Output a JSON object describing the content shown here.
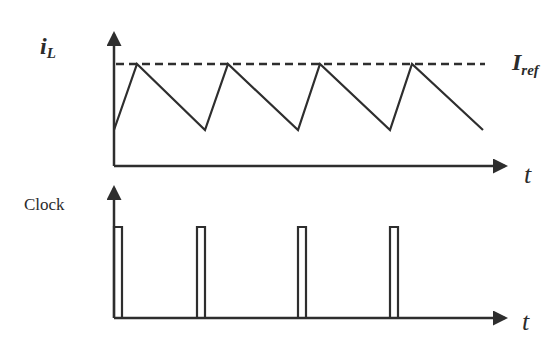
{
  "colors": {
    "line": "#2e2e2e",
    "background": "#ffffff"
  },
  "top_plot": {
    "y_label_main": "i",
    "y_label_sub": "L",
    "ref_label_main": "I",
    "ref_label_sub": "ref",
    "x_label": "t",
    "waveform_points": "114,130 137,64 205,130 228,64 298,130 320,64 390,130 412,64 483,130",
    "ref_line": {
      "x1": 116,
      "x2": 485,
      "y": 64
    }
  },
  "bottom_plot": {
    "y_label": "Clock",
    "x_label": "t",
    "pulses": [
      {
        "x": 114,
        "w": 8
      },
      {
        "x": 197,
        "w": 8
      },
      {
        "x": 298,
        "w": 8
      },
      {
        "x": 390,
        "w": 8
      }
    ],
    "pulse_top": 227,
    "baseline": 318
  },
  "chart_data": [
    {
      "type": "line",
      "title": "Inductor current vs reference",
      "ylabel": "i_L",
      "xlabel": "t",
      "annotations": [
        "I_ref (dashed reference level)"
      ],
      "series": [
        {
          "name": "i_L",
          "x": [
            0,
            0.25,
            1.0,
            1.25,
            2.0,
            2.25,
            3.0,
            3.25,
            4.0
          ],
          "values": [
            0.0,
            1.0,
            0.0,
            1.0,
            0.0,
            1.0,
            0.0,
            1.0,
            0.0
          ]
        },
        {
          "name": "I_ref",
          "x": [
            0,
            4
          ],
          "values": [
            1.0,
            1.0
          ],
          "style": "dashed"
        }
      ]
    },
    {
      "type": "line",
      "title": "Clock",
      "ylabel": "Clock",
      "xlabel": "t",
      "series": [
        {
          "name": "Clock pulses",
          "pulse_starts": [
            0,
            1,
            2,
            3
          ],
          "pulse_width": 0.09,
          "values_high": 1,
          "values_low": 0
        }
      ]
    }
  ]
}
